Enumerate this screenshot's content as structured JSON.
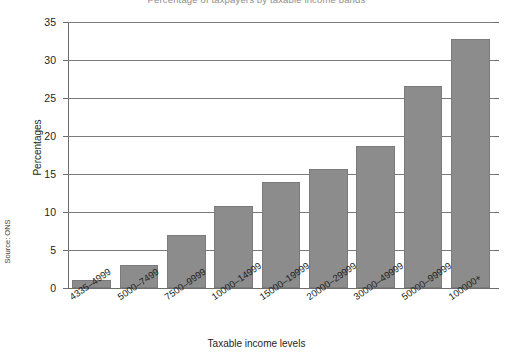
{
  "figure": {
    "title_partial": "Percentage of taxpayers by taxable income bands",
    "source_note": "Source: ONS",
    "x_axis_title": "Taxable income levels",
    "y_axis_title": "Percentages"
  },
  "colors": {
    "bar_fill": "#8c8c8c",
    "bar_stroke": "#7b7b7b",
    "gridline": "#7a7a7a",
    "axis": "#6d6d6d",
    "text": "#231f20",
    "background": "#ffffff"
  },
  "chart_data": {
    "type": "bar",
    "title": "Percentage of taxpayers by taxable income bands",
    "xlabel": "Taxable income levels",
    "ylabel": "Percentages",
    "ylim": [
      0,
      35
    ],
    "yticks": [
      0,
      5,
      10,
      15,
      20,
      25,
      30,
      35
    ],
    "grid": true,
    "legend": false,
    "source": "Source: ONS",
    "categories": [
      "4335–4999",
      "5000–7499",
      "7500–9999",
      "10000–14999",
      "15000–19999",
      "20000–29999",
      "30000–49999",
      "50000–99999",
      "100000+"
    ],
    "values": [
      1.0,
      3.0,
      7.0,
      10.8,
      13.9,
      15.7,
      18.7,
      26.6,
      32.7
    ]
  }
}
